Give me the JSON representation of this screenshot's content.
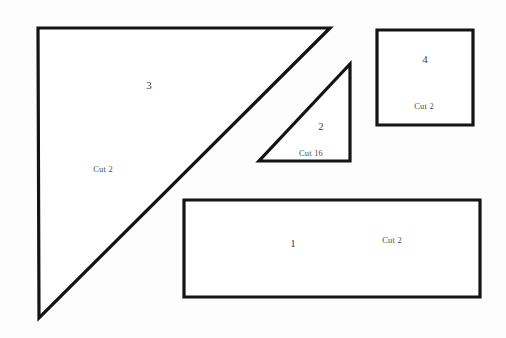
{
  "document": {
    "type": "quilt-pattern-cutting-diagram",
    "background_color": "#fdfdfd",
    "line_color": "#141414",
    "fill_color": "#ffffff",
    "text_color": "#4a4a4a"
  },
  "pieces": [
    {
      "id": "piece-3",
      "shape": "right-triangle",
      "number": "3",
      "cut": "Cut 2",
      "points": "38,28 330,28 39,318"
    },
    {
      "id": "piece-2",
      "shape": "right-triangle",
      "number": "2",
      "cut": "Cut 16",
      "points": "350,64 350,161 259,161"
    },
    {
      "id": "piece-4",
      "shape": "square",
      "number": "4",
      "cut": "Cut 2",
      "points": "377,30 473,30 473,125 377,125"
    },
    {
      "id": "piece-1",
      "shape": "rectangle",
      "number": "1",
      "cut": "Cut 2",
      "points": "184,200 480,200 480,297 184,297"
    }
  ]
}
